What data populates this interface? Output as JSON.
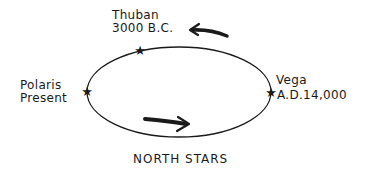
{
  "diagram": {
    "title": "NORTH STARS",
    "stars": [
      {
        "name": "Thuban",
        "era": "3000 B.C."
      },
      {
        "name": "Polaris",
        "era": "Present"
      },
      {
        "name": "Vega",
        "era": "A.D.14,000"
      }
    ],
    "orbit": {
      "shape": "ellipse",
      "direction": "clockwise"
    },
    "colors": {
      "ink": "#1a1a1a",
      "background": "#ffffff"
    }
  }
}
